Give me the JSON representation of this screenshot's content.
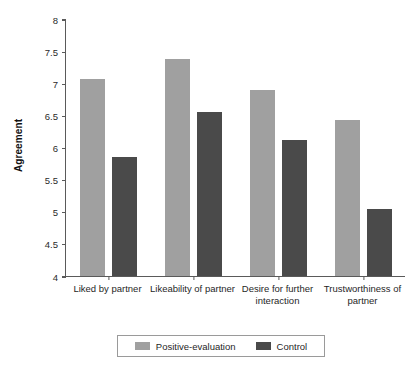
{
  "chart_data": {
    "type": "bar",
    "title": "",
    "xlabel": "",
    "ylabel": "Agreement",
    "ylim": [
      4,
      8
    ],
    "yticks": [
      4,
      4.5,
      5,
      5.5,
      6,
      6.5,
      7,
      7.5,
      8
    ],
    "ytick_labels": [
      "4",
      "4.5",
      "5",
      "5.5",
      "6",
      "6.5",
      "7",
      "7.5",
      "8"
    ],
    "grid": false,
    "legend_position": "bottom",
    "categories": [
      "Liked by partner",
      "Likeability of partner",
      "Desire for further interaction",
      "Trustworthiness of partner"
    ],
    "series": [
      {
        "name": "Positive-evaluation",
        "color": "#a0a0a0",
        "values": [
          7.07,
          7.38,
          6.9,
          6.43
        ]
      },
      {
        "name": "Control",
        "color": "#4a4a4a",
        "values": [
          5.86,
          6.55,
          6.12,
          5.04
        ]
      }
    ]
  },
  "legend": {
    "items": [
      {
        "label": "Positive-evaluation"
      },
      {
        "label": "Control"
      }
    ]
  }
}
